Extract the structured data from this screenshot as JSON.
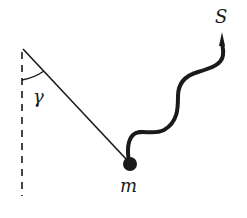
{
  "diagram": {
    "labels": {
      "source": "S",
      "angle": "γ",
      "mass": "m"
    },
    "colors": {
      "ink": "#1a1a1a",
      "background": "#ffffff"
    }
  }
}
